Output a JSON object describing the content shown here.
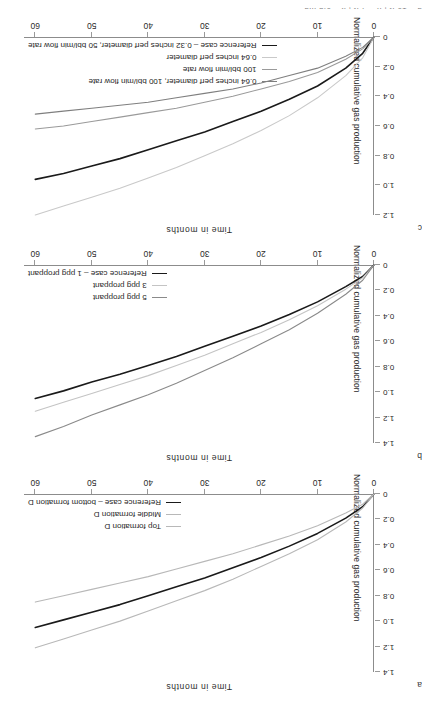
{
  "figure": {
    "clipped_top_fragment": "d = 10 ft ; h = 4 ft ; k = 0.3 md",
    "panels": [
      "a",
      "b",
      "c"
    ]
  },
  "axis": {
    "x_title": "Time in months",
    "y_title": "Normalized cumulative gas production",
    "x_ticks": [
      "0",
      "10",
      "20",
      "30",
      "40",
      "50",
      "60"
    ]
  },
  "colors": {
    "reference": "#1a1a1a",
    "mid_gray": "#8a8a8a",
    "light_gray": "#c4c4c4",
    "dark_gray": "#5a5a5a",
    "axis": "#8c8c8c"
  },
  "chart_data": [
    {
      "id": "a",
      "letter": "a",
      "type": "line",
      "title": "",
      "xlabel": "Time in months",
      "ylabel": "Normalized cumulative gas production",
      "xlim": [
        0,
        62
      ],
      "ylim": [
        0,
        1.4
      ],
      "x_ticks": [
        0,
        10,
        20,
        30,
        40,
        50,
        60
      ],
      "y_ticks": [
        0,
        0.2,
        0.4,
        0.6,
        0.8,
        1.0,
        1.2,
        1.4
      ],
      "y_tick_labels": [
        "0",
        "0.2",
        "0.4",
        "0.6",
        "0.8",
        "1.0",
        "1.2",
        "1.4"
      ],
      "grid": false,
      "legend_position": "lower right",
      "x": [
        0,
        2,
        5,
        10,
        15,
        20,
        25,
        30,
        35,
        40,
        45,
        50,
        55,
        60
      ],
      "series": [
        {
          "name": "Reference case – bottom formation D",
          "color": "#1a1a1a",
          "values": [
            0,
            0.1,
            0.19,
            0.31,
            0.41,
            0.5,
            0.58,
            0.66,
            0.73,
            0.8,
            0.87,
            0.93,
            0.99,
            1.05
          ]
        },
        {
          "name": "Middle formation D",
          "color": "#b8b8b8",
          "values": [
            0,
            0.08,
            0.15,
            0.25,
            0.33,
            0.4,
            0.47,
            0.53,
            0.59,
            0.65,
            0.7,
            0.75,
            0.8,
            0.85
          ]
        },
        {
          "name": "Top formation D",
          "color": "#b8b8b8",
          "values": [
            0,
            0.11,
            0.22,
            0.36,
            0.47,
            0.57,
            0.67,
            0.76,
            0.84,
            0.92,
            1.0,
            1.07,
            1.14,
            1.21
          ]
        }
      ]
    },
    {
      "id": "b",
      "letter": "b",
      "type": "line",
      "title": "",
      "xlabel": "Time in months",
      "ylabel": "Normalized cumulative gas production",
      "xlim": [
        0,
        62
      ],
      "ylim": [
        0,
        1.4
      ],
      "x_ticks": [
        0,
        10,
        20,
        30,
        40,
        50,
        60
      ],
      "y_ticks": [
        0,
        0.2,
        0.4,
        0.6,
        0.8,
        1.0,
        1.2,
        1.4
      ],
      "y_tick_labels": [
        "0",
        "0.2",
        "0.4",
        "0.6",
        "0.8",
        "1.0",
        "1.2",
        "1.4"
      ],
      "grid": false,
      "legend_position": "lower right",
      "x": [
        0,
        2,
        5,
        10,
        15,
        20,
        25,
        30,
        35,
        40,
        45,
        50,
        55,
        60
      ],
      "series": [
        {
          "name": "Reference case – 1 ppg proppant",
          "color": "#1a1a1a",
          "values": [
            0,
            0.09,
            0.17,
            0.29,
            0.39,
            0.48,
            0.56,
            0.64,
            0.72,
            0.79,
            0.86,
            0.92,
            0.99,
            1.05
          ]
        },
        {
          "name": "3 ppg proppant",
          "color": "#c4c4c4",
          "values": [
            0,
            0.1,
            0.19,
            0.32,
            0.43,
            0.53,
            0.62,
            0.71,
            0.79,
            0.87,
            0.94,
            1.01,
            1.08,
            1.15
          ]
        },
        {
          "name": "5 ppg proppant",
          "color": "#8a8a8a",
          "values": [
            0,
            0.12,
            0.23,
            0.38,
            0.51,
            0.62,
            0.73,
            0.83,
            0.93,
            1.02,
            1.1,
            1.18,
            1.27,
            1.35
          ]
        }
      ]
    },
    {
      "id": "c",
      "letter": "c",
      "type": "line",
      "title": "",
      "xlabel": "Time in months",
      "ylabel": "Normalized cumulative gas production",
      "xlim": [
        0,
        62
      ],
      "ylim": [
        0,
        1.2
      ],
      "x_ticks": [
        0,
        10,
        20,
        30,
        40,
        50,
        60
      ],
      "y_ticks": [
        0,
        0.2,
        0.4,
        0.6,
        0.8,
        1.0,
        1.2
      ],
      "y_tick_labels": [
        "0",
        "0.2",
        "0.4",
        "0.6",
        "0.8",
        "1.0",
        "1.2"
      ],
      "grid": false,
      "legend_position": "lower right",
      "x": [
        0,
        2,
        5,
        10,
        15,
        20,
        25,
        30,
        35,
        40,
        45,
        50,
        55,
        60
      ],
      "series": [
        {
          "name": "Reference case – 0.32 inches perf diameter, 50 bbl/min flow rate",
          "color": "#1a1a1a",
          "values": [
            0,
            0.11,
            0.21,
            0.33,
            0.42,
            0.5,
            0.57,
            0.64,
            0.7,
            0.76,
            0.82,
            0.87,
            0.92,
            0.96
          ]
        },
        {
          "name": "0.64 inches perf diameter",
          "color": "#c9c9c9",
          "values": [
            0,
            0.14,
            0.26,
            0.41,
            0.53,
            0.63,
            0.72,
            0.8,
            0.88,
            0.95,
            1.02,
            1.08,
            1.14,
            1.2
          ]
        },
        {
          "name": "100 bbl/min flow rate",
          "color": "#9a9a9a",
          "values": [
            0,
            0.08,
            0.15,
            0.24,
            0.3,
            0.35,
            0.4,
            0.44,
            0.48,
            0.51,
            0.54,
            0.57,
            0.6,
            0.62
          ]
        },
        {
          "name": "0.64 inches perf diameter, 100 bbl/min flow rate",
          "color": "#7f7f7f",
          "values": [
            0,
            0.07,
            0.13,
            0.21,
            0.26,
            0.31,
            0.35,
            0.38,
            0.41,
            0.44,
            0.46,
            0.48,
            0.5,
            0.52
          ]
        }
      ]
    }
  ]
}
